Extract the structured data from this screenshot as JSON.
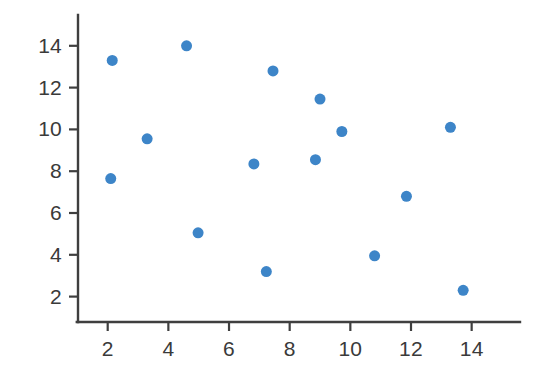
{
  "chart_data": {
    "type": "scatter",
    "title": "",
    "subtitle": "",
    "xlabel": "",
    "ylabel": "",
    "xlim": [
      0.6,
      15.2
    ],
    "ylim": [
      1.0,
      15.3
    ],
    "xticks": [
      2,
      4,
      6,
      8,
      10,
      12,
      14
    ],
    "yticks": [
      2,
      4,
      6,
      8,
      10,
      12,
      14
    ],
    "xticklabels": [
      "2",
      "4",
      "6",
      "8",
      "10",
      "12",
      "14"
    ],
    "yticklabels": [
      "2",
      "4",
      "6",
      "8",
      "10",
      "12",
      "14"
    ],
    "grid": false,
    "legend": false,
    "legend_position": "none",
    "marker": "circle",
    "marker_size": 11,
    "marker_color": "#3d85c8",
    "axis_color": "#3f3f3f",
    "tick_label_color": "#3a3a3a",
    "background_color": "#ffffff",
    "series": [
      {
        "name": "series-1",
        "color": "#3d85c8",
        "points": [
          {
            "x": 2.1,
            "y": 7.65
          },
          {
            "x": 2.15,
            "y": 13.3
          },
          {
            "x": 3.3,
            "y": 9.55
          },
          {
            "x": 4.6,
            "y": 14.0
          },
          {
            "x": 4.98,
            "y": 5.05
          },
          {
            "x": 6.82,
            "y": 8.35
          },
          {
            "x": 7.23,
            "y": 3.2
          },
          {
            "x": 7.45,
            "y": 12.8
          },
          {
            "x": 8.85,
            "y": 8.55
          },
          {
            "x": 9.0,
            "y": 11.45
          },
          {
            "x": 9.72,
            "y": 9.9
          },
          {
            "x": 10.8,
            "y": 3.95
          },
          {
            "x": 11.85,
            "y": 6.8
          },
          {
            "x": 13.3,
            "y": 10.1
          },
          {
            "x": 13.72,
            "y": 2.3
          }
        ]
      }
    ]
  },
  "geometry": {
    "width": 549,
    "height": 379,
    "axis_x_px": 78,
    "axis_y_px": 322,
    "axis_top_px": 15,
    "axis_right_px": 520,
    "x_origin_px": 107.7,
    "x_scale_px_per_unit": 30.33,
    "y_origin_px": 296.6,
    "y_scale_px_per_unit": 20.9,
    "tick_len": 9
  }
}
